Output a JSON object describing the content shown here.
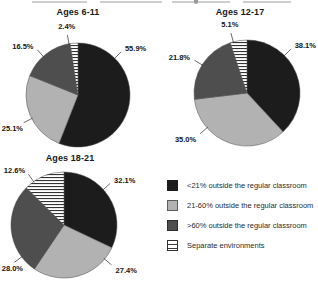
{
  "colors": {
    "lt21": "#1c1c1c",
    "p21_60": "#b2b2b2",
    "gt60": "#4e4e4e",
    "stripe_bg": "#ffffff",
    "stripe_line": "#333333",
    "outline": "#4a4a4a",
    "label_text": "#141414"
  },
  "legend": {
    "position": "bottom-right",
    "items": [
      {
        "label": "<21% outside the regular classroom",
        "swatch": "solid-black"
      },
      {
        "label": "21-60% outside the regular classroom",
        "swatch": "solid-light-gray"
      },
      {
        "label": ">60% outside the regular classroom",
        "swatch": "solid-dark-gray"
      },
      {
        "label": "Separate environments",
        "swatch": "white-horizontal-stripes"
      }
    ]
  },
  "chart_data": [
    {
      "type": "pie",
      "title": "Ages 6-11",
      "categories": [
        "<21% outside the regular classroom",
        "21-60% outside the regular classroom",
        ">60% outside the regular classroom",
        "Separate environments"
      ],
      "values": [
        55.9,
        25.1,
        16.5,
        2.4
      ],
      "unit": "%",
      "start_angle": "12-o'clock",
      "direction": "clockwise"
    },
    {
      "type": "pie",
      "title": "Ages 12-17",
      "categories": [
        "<21% outside the regular classroom",
        "21-60% outside the regular classroom",
        ">60% outside the regular classroom",
        "Separate environments"
      ],
      "values": [
        38.1,
        35.0,
        21.8,
        5.1
      ],
      "unit": "%",
      "start_angle": "12-o'clock",
      "direction": "clockwise"
    },
    {
      "type": "pie",
      "title": "Ages 18-21",
      "categories": [
        "<21% outside the regular classroom",
        "21-60% outside the regular classroom",
        ">60% outside the regular classroom",
        "Separate environments"
      ],
      "values": [
        32.1,
        27.4,
        28.0,
        12.6
      ],
      "unit": "%",
      "start_angle": "12-o'clock",
      "direction": "clockwise"
    }
  ]
}
